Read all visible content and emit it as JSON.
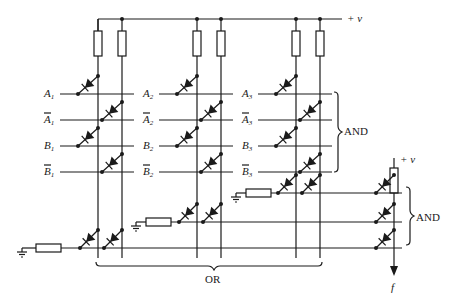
{
  "diagram": {
    "supply_label": "+ v",
    "output_label": "f",
    "and_label_top": "AND",
    "and_label_right": "AND",
    "or_label": "OR",
    "input_groups": [
      {
        "x_left": 98,
        "x_right": 122,
        "rows": [
          {
            "base": "A",
            "sub": "1",
            "bar": false
          },
          {
            "base": "A",
            "sub": "1",
            "bar": true
          },
          {
            "base": "B",
            "sub": "1",
            "bar": false
          },
          {
            "base": "B",
            "sub": "1",
            "bar": true
          }
        ]
      },
      {
        "x_left": 197,
        "x_right": 221,
        "rows": [
          {
            "base": "A",
            "sub": "2",
            "bar": false
          },
          {
            "base": "A",
            "sub": "2",
            "bar": true
          },
          {
            "base": "B",
            "sub": "2",
            "bar": false
          },
          {
            "base": "B",
            "sub": "2",
            "bar": true
          }
        ]
      },
      {
        "x_left": 296,
        "x_right": 320,
        "rows": [
          {
            "base": "A",
            "sub": "3",
            "bar": false
          },
          {
            "base": "A",
            "sub": "3",
            "bar": true
          },
          {
            "base": "B",
            "sub": "3",
            "bar": false
          },
          {
            "base": "B",
            "sub": "3",
            "bar": true
          }
        ]
      }
    ]
  }
}
